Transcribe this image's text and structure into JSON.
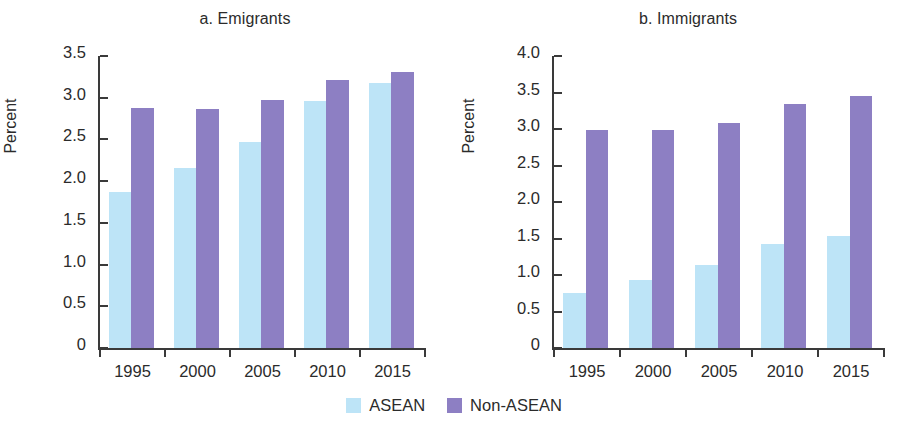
{
  "figure": {
    "legend": [
      {
        "label": "ASEAN",
        "color": "#bde4f7",
        "icon": "legend-swatch-icon"
      },
      {
        "label": "Non-ASEAN",
        "color": "#8d7fc3",
        "icon": "legend-swatch-icon"
      }
    ]
  },
  "chart_data": [
    {
      "type": "bar",
      "title": "a. Emigrants",
      "xlabel": "",
      "ylabel": "Percent",
      "categories": [
        "1995",
        "2000",
        "2005",
        "2010",
        "2015"
      ],
      "series": [
        {
          "name": "ASEAN",
          "color": "#bde4f7",
          "values": [
            1.87,
            2.16,
            2.47,
            2.96,
            3.18
          ]
        },
        {
          "name": "Non-ASEAN",
          "color": "#8d7fc3",
          "values": [
            2.88,
            2.87,
            2.97,
            3.21,
            3.31
          ]
        }
      ],
      "ylim": [
        0,
        3.5
      ],
      "yticks": [
        "0",
        "0.5",
        "1.0",
        "1.5",
        "2.0",
        "2.5",
        "3.0",
        "3.5"
      ],
      "ytick_values": [
        0,
        0.5,
        1.0,
        1.5,
        2.0,
        2.5,
        3.0,
        3.5
      ],
      "grid": false,
      "legend_position": "bottom"
    },
    {
      "type": "bar",
      "title": "b. Immigrants",
      "xlabel": "",
      "ylabel": "Percent",
      "categories": [
        "1995",
        "2000",
        "2005",
        "2010",
        "2015"
      ],
      "series": [
        {
          "name": "ASEAN",
          "color": "#bde4f7",
          "values": [
            0.75,
            0.93,
            1.14,
            1.43,
            1.53
          ]
        },
        {
          "name": "Non-ASEAN",
          "color": "#8d7fc3",
          "values": [
            2.99,
            2.99,
            3.08,
            3.34,
            3.45
          ]
        }
      ],
      "ylim": [
        0,
        4.0
      ],
      "yticks": [
        "0",
        "0.5",
        "1.0",
        "1.5",
        "2.0",
        "2.5",
        "3.0",
        "3.5",
        "4.0"
      ],
      "ytick_values": [
        0,
        0.5,
        1.0,
        1.5,
        2.0,
        2.5,
        3.0,
        3.5,
        4.0
      ],
      "grid": false,
      "legend_position": "bottom"
    }
  ]
}
